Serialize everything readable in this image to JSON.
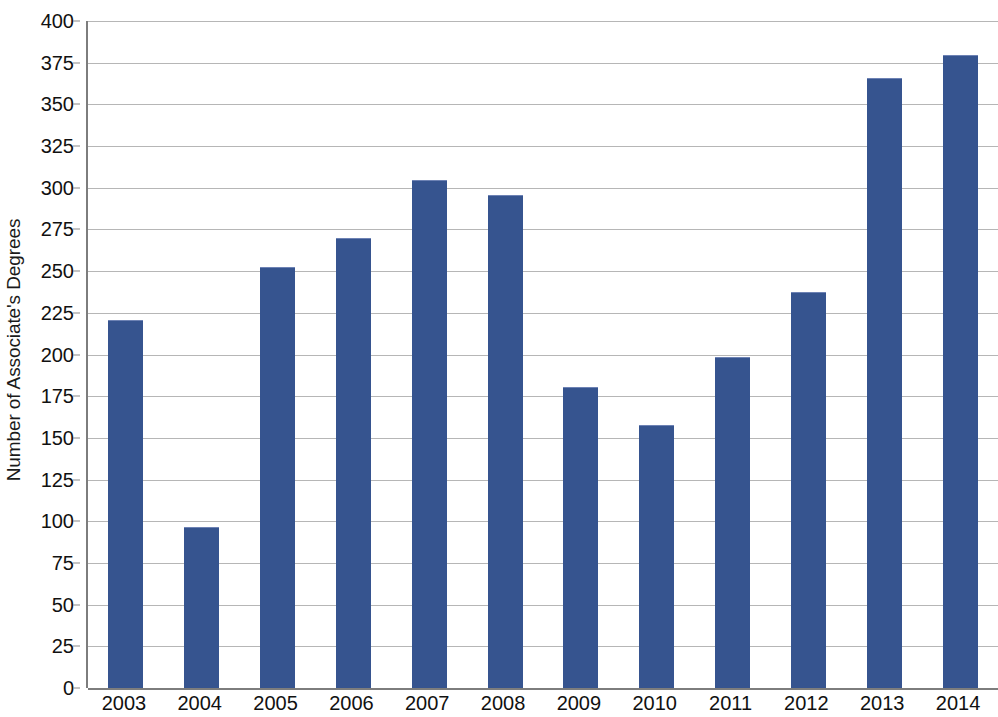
{
  "chart_data": {
    "type": "bar",
    "title": "",
    "subtitle": "",
    "xlabel": "",
    "ylabel": "Number of Associate's Degrees",
    "categories": [
      "2003",
      "2004",
      "2005",
      "2006",
      "2007",
      "2008",
      "2009",
      "2010",
      "2011",
      "2012",
      "2013",
      "2014"
    ],
    "values": [
      220,
      96,
      252,
      269,
      304,
      295,
      180,
      157,
      198,
      237,
      365,
      379
    ],
    "series": [
      {
        "name": "Number of Associate's Degrees",
        "values": [
          220,
          96,
          252,
          269,
          304,
          295,
          180,
          157,
          198,
          237,
          365,
          379
        ],
        "color": "#36548f"
      }
    ],
    "ylim": [
      0,
      400
    ],
    "ytick_step": 25,
    "ytick_labels": [
      "400",
      "375",
      "350",
      "325",
      "300",
      "275",
      "250",
      "225",
      "200",
      "175",
      "150",
      "125",
      "100",
      "75",
      "50",
      "25",
      "0"
    ],
    "ytick_values": [
      400,
      375,
      350,
      325,
      300,
      275,
      250,
      225,
      200,
      175,
      150,
      125,
      100,
      75,
      50,
      25,
      0
    ],
    "grid": true,
    "grid_axis": "y",
    "legend": false,
    "legend_position": "none",
    "bar_color": "#36548f",
    "gridline_color": "#b6b6b6",
    "axis_color": "#7d7d7d",
    "background_color": "#ffffff",
    "annotations": []
  }
}
